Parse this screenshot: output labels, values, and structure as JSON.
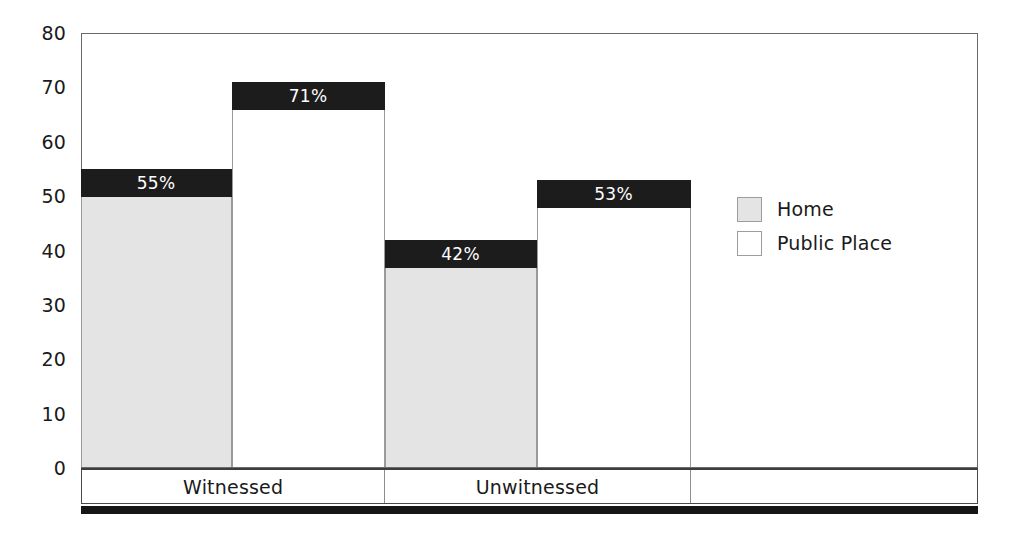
{
  "chart_data": {
    "type": "bar",
    "title": "",
    "subtitle": "",
    "xlabel": "",
    "ylabel": "",
    "ylim": [
      0,
      80
    ],
    "yticks": [
      0,
      10,
      20,
      30,
      40,
      50,
      60,
      70,
      80
    ],
    "ytick_labels": [
      "0",
      "10",
      "20",
      "30",
      "40",
      "50",
      "60",
      "70",
      "80"
    ],
    "grid": false,
    "legend_position": "right",
    "categories": [
      "Witnessed",
      "Unwitnessed"
    ],
    "series": [
      {
        "name": "Home",
        "values": [
          55,
          42
        ],
        "data_labels": [
          "55%",
          "42%"
        ],
        "fill": "#e4e4e4"
      },
      {
        "name": "Public Place",
        "values": [
          71,
          53
        ],
        "data_labels": [
          "71%",
          "53%"
        ],
        "fill": "#ffffff"
      }
    ],
    "bars": [
      {
        "label": "55%",
        "value": 55,
        "series": "Home",
        "category": "Witnessed",
        "fill_class": "fill-home"
      },
      {
        "label": "71%",
        "value": 71,
        "series": "Public Place",
        "category": "Witnessed",
        "fill_class": "fill-public"
      },
      {
        "label": "42%",
        "value": 42,
        "series": "Home",
        "category": "Unwitnessed",
        "fill_class": "fill-home"
      },
      {
        "label": "53%",
        "value": 53,
        "series": "Public Place",
        "category": "Unwitnessed",
        "fill_class": "fill-public"
      }
    ],
    "category_cells": [
      "Witnessed",
      "Unwitnessed",
      ""
    ],
    "colors": {
      "home_fill": "#e4e4e4",
      "public_fill": "#ffffff",
      "label_band": "#1c1c1c",
      "label_text": "#ffffff",
      "axis": "#6b6b6b",
      "text": "#1a1a1a"
    }
  },
  "legend": {
    "items": [
      {
        "label": "Home",
        "swatch_class": "sw-home"
      },
      {
        "label": "Public Place",
        "swatch_class": "sw-public"
      }
    ]
  }
}
